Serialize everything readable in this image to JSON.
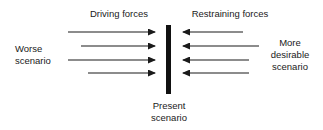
{
  "diagram": {
    "type": "force-field-analysis",
    "headings": {
      "driving": "Driving forces",
      "restraining": "Restraining forces"
    },
    "left_label": {
      "line1": "Worse",
      "line2": "scenario"
    },
    "right_label": {
      "line1": "More",
      "line2": "desirable",
      "line3": "scenario"
    },
    "center_label": {
      "line1": "Present",
      "line2": "scenario"
    },
    "driving_arrows": [
      {
        "x1": 68,
        "x2": 155,
        "y": 32
      },
      {
        "x1": 81,
        "x2": 155,
        "y": 46
      },
      {
        "x1": 68,
        "x2": 155,
        "y": 60
      },
      {
        "x1": 88,
        "x2": 155,
        "y": 73
      }
    ],
    "restraining_arrows": [
      {
        "x1": 243,
        "x2": 183,
        "y": 32
      },
      {
        "x1": 259,
        "x2": 183,
        "y": 46
      },
      {
        "x1": 249,
        "x2": 183,
        "y": 60
      },
      {
        "x1": 249,
        "x2": 183,
        "y": 73
      }
    ],
    "colors": {
      "line": "#1a1a1a",
      "background": "#ffffff"
    }
  }
}
